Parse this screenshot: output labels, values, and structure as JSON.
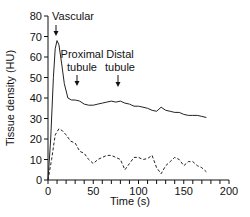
{
  "chart_data": {
    "type": "line",
    "title": "",
    "xlabel": "Time (s)",
    "ylabel": "Tissue density (HU)",
    "xlim": [
      0,
      200
    ],
    "ylim": [
      0,
      80
    ],
    "xticks": [
      0,
      50,
      100,
      150,
      200
    ],
    "yticks": [
      0,
      10,
      20,
      30,
      40,
      50,
      60,
      70,
      80
    ],
    "grid": false,
    "legend": null,
    "annotations": [
      {
        "text": "Vascular",
        "x": 10,
        "y": 72,
        "arrow": true
      },
      {
        "text": "Proximal tubule",
        "x": 30,
        "y": 42,
        "arrow": true
      },
      {
        "text": "Distal tubule",
        "x": 80,
        "y": 41,
        "arrow": true
      }
    ],
    "series": [
      {
        "name": "solid",
        "style": "solid",
        "x": [
          0,
          3,
          6,
          8,
          10,
          12,
          15,
          18,
          22,
          26,
          30,
          35,
          40,
          45,
          50,
          55,
          60,
          65,
          70,
          75,
          80,
          85,
          90,
          95,
          100,
          105,
          110,
          115,
          120,
          125,
          130,
          135,
          140,
          145,
          150,
          155,
          160,
          165,
          170,
          175
        ],
        "values": [
          0,
          20,
          50,
          64,
          68,
          66,
          57,
          47,
          40,
          39,
          39,
          38.5,
          37,
          36.5,
          36.5,
          37,
          37.5,
          38,
          38.5,
          38,
          38.5,
          37.5,
          37,
          36,
          36,
          35.5,
          35,
          34,
          33.5,
          35.5,
          34,
          33.5,
          33,
          33,
          32,
          31.5,
          31.5,
          31.5,
          31,
          30.5
        ]
      },
      {
        "name": "dashed",
        "style": "dashed",
        "x": [
          0,
          4,
          8,
          12,
          16,
          20,
          25,
          30,
          35,
          40,
          45,
          50,
          55,
          60,
          65,
          70,
          75,
          80,
          85,
          90,
          95,
          100,
          105,
          110,
          115,
          120,
          125,
          130,
          135,
          140,
          145,
          150,
          155,
          160,
          165,
          170,
          175
        ],
        "values": [
          0,
          10,
          22,
          25,
          24,
          22,
          19,
          18,
          14,
          13,
          10,
          8,
          10,
          11,
          12,
          12,
          11,
          10,
          5,
          8,
          11,
          11,
          10,
          10.5,
          12,
          6,
          3,
          7,
          9,
          11,
          10,
          7,
          9,
          9,
          7,
          6,
          4
        ]
      }
    ]
  }
}
